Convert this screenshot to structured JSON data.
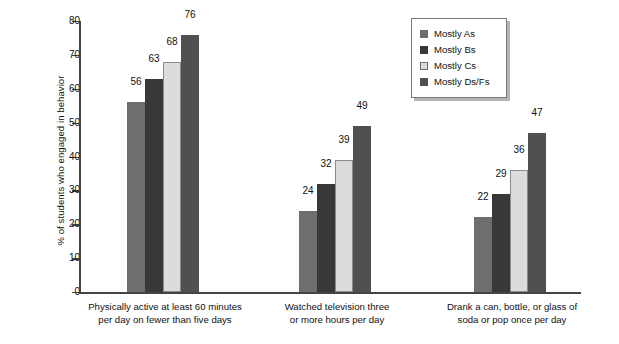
{
  "chart_data": {
    "type": "bar",
    "title": "",
    "xlabel": "",
    "ylabel": "% of students who engaged in behavior",
    "ylim": [
      0,
      80
    ],
    "y_ticks": [
      0,
      10,
      20,
      30,
      40,
      50,
      60,
      70,
      80
    ],
    "grid": false,
    "legend_position": "top-right",
    "categories": [
      "Physically active at least 60 minutes per day on fewer than five days",
      "Watched television three or more hours per day",
      "Drank a can, bottle, or glass of soda or pop once per day"
    ],
    "category_lines": [
      [
        "Physically active at least 60 minutes",
        "per day on fewer than five days"
      ],
      [
        "Watched television three",
        "or more hours per day"
      ],
      [
        "Drank a can, bottle, or glass of",
        "soda or pop once per day"
      ]
    ],
    "series": [
      {
        "name": "Mostly As",
        "color": "#6e6e6e",
        "values": [
          56,
          24,
          22
        ]
      },
      {
        "name": "Mostly Bs",
        "color": "#383838",
        "values": [
          63,
          32,
          29
        ]
      },
      {
        "name": "Mostly Cs",
        "color": "#dcdcdc",
        "values": [
          68,
          39,
          36
        ]
      },
      {
        "name": "Mostly Ds/Fs",
        "color": "#505050",
        "values": [
          76,
          49,
          47
        ]
      }
    ]
  },
  "legend": {
    "items": [
      {
        "label": "Mostly As",
        "swatch": "#6e6e6e"
      },
      {
        "label": "Mostly Bs",
        "swatch": "#383838"
      },
      {
        "label": "Mostly Cs",
        "swatch": "#dcdcdc"
      },
      {
        "label": "Mostly Ds/Fs",
        "swatch": "#505050"
      }
    ]
  },
  "axis": {
    "y_title": "% of students who engaged in behavior",
    "y_tick_labels": [
      "0",
      "10",
      "20",
      "30",
      "40",
      "50",
      "60",
      "70",
      "80"
    ]
  }
}
